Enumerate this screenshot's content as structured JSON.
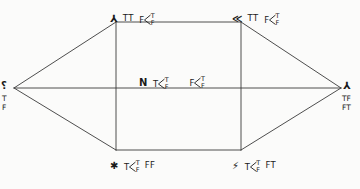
{
  "figure": {
    "background_color": "#fbfbfa",
    "line_color": "#3a3a3a",
    "text_color": "#1b1b1b",
    "width": 360,
    "height": 189
  },
  "geometry": {
    "left_vertex": {
      "x": 14,
      "y": 88
    },
    "right_vertex": {
      "x": 341,
      "y": 88
    },
    "top_left": {
      "x": 116,
      "y": 22
    },
    "top_right": {
      "x": 241,
      "y": 22
    },
    "bottom_left": {
      "x": 116,
      "y": 150
    },
    "bottom_right": {
      "x": 241,
      "y": 150
    },
    "edges": [
      "left_vertex-top_left",
      "left_vertex-bottom_left",
      "left_vertex-right_vertex",
      "top_left-top_right",
      "top_left-bottom_left",
      "top_right-bottom_right",
      "bottom_left-bottom_right",
      "top_right-right_vertex",
      "bottom_right-right_vertex"
    ]
  },
  "nodes": {
    "top_left": {
      "marker": "⅄",
      "prefix": "TT",
      "head": "F",
      "branch_top": "T",
      "branch_bottom": "F",
      "suffix": ""
    },
    "top_right": {
      "marker": "≪",
      "prefix": "TT",
      "head": "F",
      "branch_top": "T",
      "branch_bottom": "F",
      "suffix": ""
    },
    "center_left": {
      "marker": "N",
      "prefix": "",
      "head": "T",
      "branch_top": "T",
      "branch_bottom": "F",
      "suffix": ""
    },
    "center_right": {
      "marker": "",
      "prefix": "",
      "head": "F",
      "branch_top": "T",
      "branch_bottom": "F",
      "suffix": ""
    },
    "bottom_left": {
      "marker": "✱",
      "prefix": "",
      "head": "T",
      "branch_top": "T",
      "branch_bottom": "F",
      "suffix": "FF"
    },
    "bottom_right": {
      "marker": "⚡",
      "prefix": "",
      "head": "T",
      "branch_top": "T",
      "branch_bottom": "F",
      "suffix": "FT"
    },
    "left_vertex": {
      "glyph": "⸮",
      "stack_line_1": "T",
      "stack_line_2": "F"
    },
    "right_vertex": {
      "glyph": "⅄",
      "stack_line_1": "TF",
      "stack_line_2": "FT"
    }
  }
}
